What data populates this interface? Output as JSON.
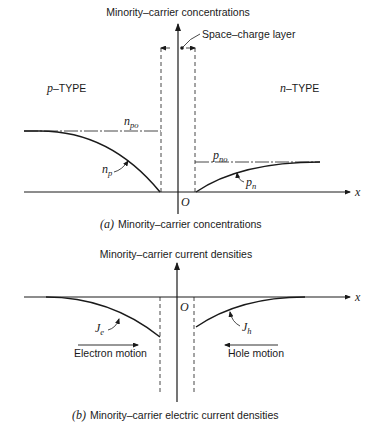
{
  "figure_a": {
    "y_axis_title": "Minority–carrier concentrations",
    "space_charge_label": "Space–charge layer",
    "p_type_prefix": "p",
    "p_type_suffix": "–TYPE",
    "n_type_prefix": "n",
    "n_type_suffix": "–TYPE",
    "npo_main": "n",
    "npo_sub": "po",
    "np_main": "n",
    "np_sub": "p",
    "pno_main": "p",
    "pno_sub": "no",
    "pn_main": "p",
    "pn_sub": "n",
    "origin": "O",
    "x_label": "x",
    "caption_tag": "(a)",
    "caption_text": "Minority–carrier concentrations"
  },
  "figure_b": {
    "y_axis_title": "Minority–carrier current densities",
    "je_main": "J",
    "je_sub": "e",
    "jh_main": "J",
    "jh_sub": "h",
    "electron_motion": "Electron motion",
    "hole_motion": "Hole motion",
    "origin": "O",
    "x_label": "x",
    "caption_tag": "(b)",
    "caption_text": "Minority–carrier electric current densities"
  }
}
